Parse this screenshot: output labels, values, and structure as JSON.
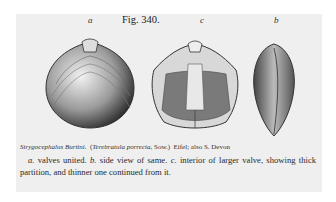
{
  "figure": {
    "title": "Fig. 340.",
    "labels": {
      "a": "a",
      "c": "c",
      "b": "b"
    },
    "caption": {
      "species": "Strygocephalus Burtini.",
      "synonym_open": "(",
      "synonym": "Terebratula porrecta",
      "synonym_author": ", Sow.)",
      "locality": "Eifel; also S. Devon"
    },
    "description": {
      "a_key": "a.",
      "a_text": " valves united. ",
      "b_key": "b.",
      "b_text": " side view of same. ",
      "c_key": "c.",
      "c_text": " interior of larger valve, showing thick partition, and thinner one continued from it."
    },
    "illustrations": [
      {
        "id": "a",
        "description": "exterior view of valves united"
      },
      {
        "id": "c",
        "description": "interior of larger valve"
      },
      {
        "id": "b",
        "description": "side view"
      }
    ]
  }
}
